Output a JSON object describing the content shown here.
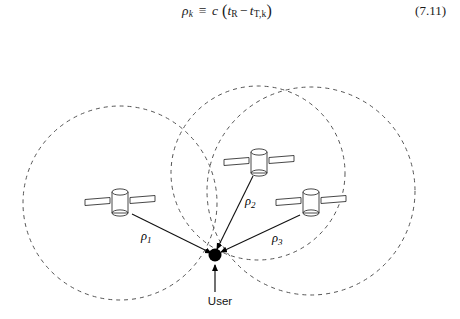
{
  "equation": {
    "lhs_symbol": "ρ",
    "lhs_sub": "k",
    "relation": "≡",
    "speed_symbol": "c",
    "open_paren": "(",
    "term1_symbol": "t",
    "term1_sub": "R",
    "minus": "−",
    "term2_symbol": "t",
    "term2_sub": "T,k",
    "close_paren": ")",
    "full_text": "ρk ≡ c (tR − tT,k)",
    "number": "(7.11)"
  },
  "figure": {
    "user": {
      "label": "User",
      "x": 215,
      "y": 231,
      "dot_radius": 6.5,
      "dot_color": "#000000",
      "label_x": 220,
      "label_y": 281
    },
    "circles": [
      {
        "name": "range-circle-1",
        "cx": 120,
        "cy": 179,
        "r": 97,
        "color": "#555555"
      },
      {
        "name": "range-circle-2",
        "cx": 258,
        "cy": 149,
        "r": 87,
        "color": "#555555"
      },
      {
        "name": "range-circle-3",
        "cx": 311,
        "cy": 167,
        "r": 104,
        "color": "#555555"
      }
    ],
    "satellites": [
      {
        "name": "satellite-1",
        "cx": 120,
        "cy": 179,
        "panel_tilt": -6
      },
      {
        "name": "satellite-2",
        "cx": 259,
        "cy": 139,
        "panel_tilt": -7
      },
      {
        "name": "satellite-3",
        "cx": 311,
        "cy": 179,
        "panel_tilt": -5
      }
    ],
    "ranges": [
      {
        "name": "range-1",
        "label": "ρ",
        "index": "1",
        "from_x": 132,
        "from_y": 190,
        "to_x": 215,
        "to_y": 231,
        "label_x": 141,
        "label_y": 216
      },
      {
        "name": "range-2",
        "label": "ρ",
        "index": "2",
        "from_x": 253,
        "from_y": 152,
        "to_x": 215,
        "to_y": 231,
        "label_x": 245,
        "label_y": 181
      },
      {
        "name": "range-3",
        "label": "ρ",
        "index": "3",
        "from_x": 300,
        "from_y": 191,
        "to_x": 215,
        "to_y": 231,
        "label_x": 272,
        "label_y": 218
      }
    ],
    "user_pointer": {
      "name": "user-pointer",
      "from_x": 215,
      "from_y": 268,
      "to_x": 215,
      "to_y": 240
    },
    "stroke_color": "#222222",
    "dash_pattern": "4,4"
  }
}
